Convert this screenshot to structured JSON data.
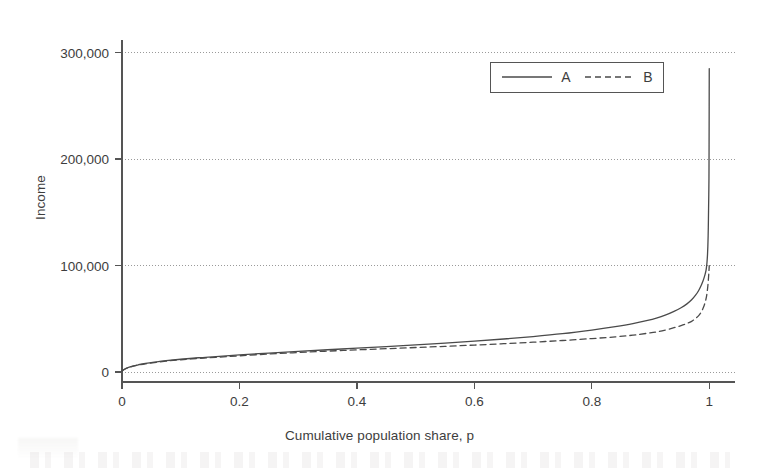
{
  "chart_data": {
    "type": "line",
    "title": "",
    "subtitle": "",
    "xlabel": "Cumulative population share, p",
    "ylabel": "Income",
    "xlim": [
      0,
      1.02
    ],
    "ylim": [
      0,
      310000
    ],
    "xticks": [
      0,
      0.2,
      0.4,
      0.6,
      0.8,
      1
    ],
    "xtick_labels": [
      "0",
      "0.2",
      "0.4",
      "0.6",
      "0.8",
      "1"
    ],
    "yticks": [
      0,
      100000,
      200000,
      300000
    ],
    "ytick_labels": [
      "0",
      "100,000",
      "200,000",
      "300,000"
    ],
    "grid": "horizontal-dotted",
    "legend_position": "top-right",
    "legend_entries": [
      {
        "label": "A",
        "style": "solid"
      },
      {
        "label": "B",
        "style": "dashed"
      }
    ],
    "series": [
      {
        "name": "A",
        "style": "solid",
        "color": "#4a4a4a",
        "x": [
          0.0,
          0.004,
          0.01,
          0.018,
          0.028,
          0.04,
          0.055,
          0.075,
          0.1,
          0.13,
          0.16,
          0.2,
          0.25,
          0.3,
          0.35,
          0.4,
          0.45,
          0.5,
          0.55,
          0.6,
          0.65,
          0.7,
          0.75,
          0.8,
          0.84,
          0.87,
          0.895,
          0.91,
          0.925,
          0.94,
          0.952,
          0.962,
          0.97,
          0.977,
          0.982,
          0.986,
          0.989,
          0.991,
          0.993,
          0.9945,
          0.9955,
          0.9963,
          0.997,
          0.9976,
          0.9981,
          0.9985,
          0.9988,
          0.9991,
          0.9993,
          0.9995,
          0.9996,
          0.9997,
          0.9998,
          0.9999,
          1.0
        ],
        "y": [
          1000,
          2600,
          4200,
          5600,
          6800,
          8000,
          9200,
          10600,
          12000,
          13400,
          14500,
          16000,
          17800,
          19400,
          20900,
          22400,
          23900,
          25500,
          27200,
          29000,
          31000,
          33300,
          36000,
          39400,
          42600,
          45400,
          48400,
          50600,
          53400,
          57000,
          60400,
          64000,
          67800,
          72400,
          76600,
          81000,
          85000,
          88200,
          92000,
          95500,
          99500,
          104000,
          110000,
          118000,
          128000,
          140000,
          152000,
          163000,
          171000,
          182000,
          196000,
          214000,
          236000,
          262000,
          285000
        ]
      },
      {
        "name": "B",
        "style": "dashed",
        "color": "#4a4a4a",
        "x": [
          0.0,
          0.004,
          0.01,
          0.018,
          0.028,
          0.04,
          0.055,
          0.075,
          0.1,
          0.13,
          0.16,
          0.2,
          0.25,
          0.3,
          0.35,
          0.4,
          0.45,
          0.5,
          0.55,
          0.6,
          0.65,
          0.7,
          0.75,
          0.8,
          0.84,
          0.87,
          0.895,
          0.91,
          0.925,
          0.94,
          0.952,
          0.962,
          0.97,
          0.977,
          0.982,
          0.986,
          0.99,
          0.993,
          0.995,
          0.9965,
          0.9978,
          0.9988,
          0.9995,
          1.0
        ],
        "y": [
          900,
          2400,
          3900,
          5300,
          6500,
          7700,
          8900,
          10200,
          11500,
          12800,
          13800,
          15200,
          16900,
          18300,
          19600,
          20800,
          21900,
          23000,
          24100,
          25300,
          26600,
          28000,
          29600,
          31400,
          33000,
          34600,
          36400,
          37600,
          39400,
          41600,
          43600,
          45600,
          47600,
          50400,
          53000,
          56000,
          60500,
          65500,
          70000,
          75500,
          82000,
          89000,
          95000,
          100000
        ]
      }
    ],
    "annotations": []
  },
  "colors": {
    "line": "#4a4a4a",
    "axis": "#555555",
    "grid": "#9a9a9a",
    "text": "#3d3d3d",
    "legend_border": "#555555",
    "background": "#ffffff"
  }
}
